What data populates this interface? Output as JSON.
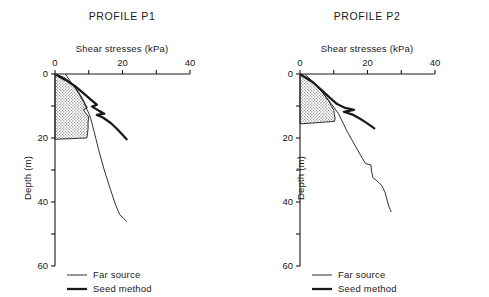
{
  "figure": {
    "background_color": "#ffffff",
    "line_color": "#1a1a1a",
    "fill_color": "#d9d9d9"
  },
  "panels": [
    {
      "id": "p1",
      "title": "PROFILE P1",
      "xlabel": "Shear stresses (kPa)",
      "ylabel": "Depth (m)",
      "xticks": [
        0,
        10,
        20,
        30,
        40
      ],
      "xticklabels": [
        "0",
        "",
        "20",
        "",
        "40"
      ],
      "yticks": [
        0,
        10,
        20,
        30,
        40,
        50,
        60
      ],
      "yticklabels": [
        "0",
        "",
        "20",
        "",
        "40",
        "",
        "60"
      ],
      "legend": [
        {
          "label": "Far source",
          "style": "thin"
        },
        {
          "label": "Seed method",
          "style": "thick"
        }
      ]
    },
    {
      "id": "p2",
      "title": "PROFILE P2",
      "xlabel": "Shear stresses (kPa)",
      "ylabel": "Depth (m)",
      "xticks": [
        0,
        10,
        20,
        30,
        40
      ],
      "xticklabels": [
        "0",
        "",
        "20",
        "",
        "40"
      ],
      "yticks": [
        0,
        10,
        20,
        30,
        40,
        50,
        60
      ],
      "yticklabels": [
        "0",
        "",
        "20",
        "",
        "40",
        "",
        "60"
      ],
      "legend": [
        {
          "label": "Far source",
          "style": "thin"
        },
        {
          "label": "Seed method",
          "style": "thick"
        }
      ]
    }
  ],
  "chart_data": [
    {
      "type": "line",
      "panel": "p1",
      "title": "PROFILE P1",
      "xlabel": "Shear stresses (kPa)",
      "ylabel": "Depth (m)",
      "xlim": [
        0,
        40
      ],
      "ylim": [
        0,
        60
      ],
      "y_inverted": true,
      "grid": false,
      "legend_position": "bottom-left",
      "series": [
        {
          "name": "Far source",
          "style": "thin",
          "points": [
            [
              3.2,
              0.2
            ],
            [
              5.0,
              3.0
            ],
            [
              7.0,
              6.0
            ],
            [
              8.6,
              9.0
            ],
            [
              9.4,
              11.0
            ],
            [
              10.0,
              12.2
            ],
            [
              10.6,
              14.0
            ],
            [
              11.6,
              18.0
            ],
            [
              13.0,
              24.0
            ],
            [
              14.6,
              30.0
            ],
            [
              16.4,
              36.0
            ],
            [
              18.0,
              41.0
            ],
            [
              19.2,
              44.0
            ],
            [
              20.4,
              45.2
            ],
            [
              21.2,
              46.0
            ]
          ]
        },
        {
          "name": "Seed method",
          "style": "thick",
          "points": [
            [
              0.4,
              0.3
            ],
            [
              3.4,
              2.0
            ],
            [
              6.2,
              4.0
            ],
            [
              8.4,
              6.0
            ],
            [
              10.6,
              8.0
            ],
            [
              12.4,
              9.6
            ],
            [
              11.0,
              10.2
            ],
            [
              13.2,
              11.6
            ],
            [
              14.6,
              12.4
            ],
            [
              12.4,
              12.8
            ],
            [
              14.2,
              13.6
            ],
            [
              16.6,
              15.4
            ],
            [
              18.4,
              17.2
            ],
            [
              20.0,
              19.0
            ],
            [
              21.2,
              20.4
            ]
          ]
        }
      ],
      "shaded_region": {
        "name": "laboratory-test-range",
        "fill": "stipple",
        "outline": [
          [
            0.0,
            0.0
          ],
          [
            2.6,
            1.0
          ],
          [
            4.6,
            2.6
          ],
          [
            6.0,
            4.2
          ],
          [
            7.2,
            6.0
          ],
          [
            8.2,
            7.8
          ],
          [
            9.0,
            9.4
          ],
          [
            9.6,
            10.6
          ],
          [
            8.4,
            11.2
          ],
          [
            9.2,
            12.4
          ],
          [
            10.0,
            13.4
          ],
          [
            9.8,
            15.0
          ],
          [
            9.8,
            17.0
          ],
          [
            9.6,
            19.0
          ],
          [
            9.4,
            20.0
          ],
          [
            0.0,
            20.4
          ]
        ]
      }
    },
    {
      "type": "line",
      "panel": "p2",
      "title": "PROFILE P2",
      "xlabel": "Shear stresses (kPa)",
      "ylabel": "Depth (m)",
      "xlim": [
        0,
        40
      ],
      "ylim": [
        0,
        60
      ],
      "y_inverted": true,
      "grid": false,
      "legend_position": "bottom-left",
      "series": [
        {
          "name": "Far source",
          "style": "thin",
          "points": [
            [
              1.6,
              0.2
            ],
            [
              4.0,
              2.6
            ],
            [
              6.4,
              5.4
            ],
            [
              8.6,
              8.4
            ],
            [
              10.2,
              10.6
            ],
            [
              11.4,
              12.4
            ],
            [
              12.6,
              15.0
            ],
            [
              14.0,
              18.0
            ],
            [
              15.6,
              21.0
            ],
            [
              17.2,
              24.0
            ],
            [
              18.6,
              26.6
            ],
            [
              19.4,
              28.0
            ],
            [
              21.0,
              28.4
            ],
            [
              21.2,
              30.4
            ],
            [
              21.6,
              32.4
            ],
            [
              22.8,
              33.4
            ],
            [
              24.2,
              34.8
            ],
            [
              25.2,
              37.0
            ],
            [
              25.8,
              39.4
            ],
            [
              26.4,
              41.6
            ],
            [
              27.0,
              43.0
            ]
          ]
        },
        {
          "name": "Seed method",
          "style": "thick",
          "points": [
            [
              0.4,
              0.3
            ],
            [
              3.6,
              2.4
            ],
            [
              6.4,
              5.0
            ],
            [
              8.8,
              7.4
            ],
            [
              11.0,
              9.4
            ],
            [
              13.4,
              10.6
            ],
            [
              16.0,
              11.2
            ],
            [
              13.0,
              11.8
            ],
            [
              15.8,
              12.8
            ],
            [
              17.8,
              14.0
            ],
            [
              19.6,
              15.2
            ],
            [
              21.0,
              16.2
            ],
            [
              22.0,
              17.0
            ]
          ]
        }
      ],
      "shaded_region": {
        "name": "laboratory-test-range",
        "fill": "stipple",
        "outline": [
          [
            0.0,
            0.0
          ],
          [
            2.4,
            1.4
          ],
          [
            4.4,
            3.2
          ],
          [
            6.0,
            5.0
          ],
          [
            7.4,
            6.8
          ],
          [
            8.6,
            8.6
          ],
          [
            9.4,
            10.2
          ],
          [
            10.0,
            11.2
          ],
          [
            10.2,
            12.6
          ],
          [
            10.4,
            14.0
          ],
          [
            10.2,
            14.8
          ],
          [
            0.0,
            15.6
          ]
        ]
      }
    }
  ]
}
